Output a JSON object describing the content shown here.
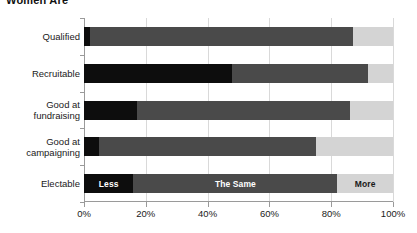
{
  "chart_data": {
    "type": "bar",
    "subtype": "stacked-horizontal-100percent",
    "title": "Women Are",
    "xlabel": "",
    "ylabel": "",
    "orientation": "horizontal",
    "xlim": [
      0,
      100
    ],
    "xticks": [
      0,
      20,
      40,
      60,
      80,
      100
    ],
    "xtick_labels": [
      "0%",
      "20%",
      "40%",
      "60%",
      "80%",
      "100%"
    ],
    "grid": true,
    "grid_axis": "x",
    "legend": "inline-on-bar",
    "legend_position": "inside-electable-bar",
    "categories": [
      "Qualified",
      "Recruitable",
      "Good at fundraising",
      "Good at campaigning",
      "Electable"
    ],
    "category_lines": [
      [
        "Qualified"
      ],
      [
        "Recruitable"
      ],
      [
        "Good at",
        "fundraising"
      ],
      [
        "Good at",
        "campaigning"
      ],
      [
        "Electable"
      ]
    ],
    "series": [
      {
        "name": "Less",
        "color": "#0d0d0d",
        "values": [
          2,
          48,
          17,
          5,
          16
        ]
      },
      {
        "name": "The Same",
        "color": "#4a4a4a",
        "values": [
          85,
          44,
          69,
          70,
          66
        ]
      },
      {
        "name": "More",
        "color": "#d4d4d4",
        "values": [
          13,
          8,
          14,
          25,
          18
        ]
      }
    ],
    "bar_labels": {
      "Electable": {
        "Less": "Less",
        "The Same": "The Same",
        "More": "More"
      }
    }
  },
  "colors": {
    "less": "#0d0d0d",
    "same": "#4a4a4a",
    "more": "#d4d4d4",
    "grid": "#d9d9d9",
    "axis": "#9a9a9a",
    "background": "#ffffff",
    "text": "#1a1a1a"
  }
}
